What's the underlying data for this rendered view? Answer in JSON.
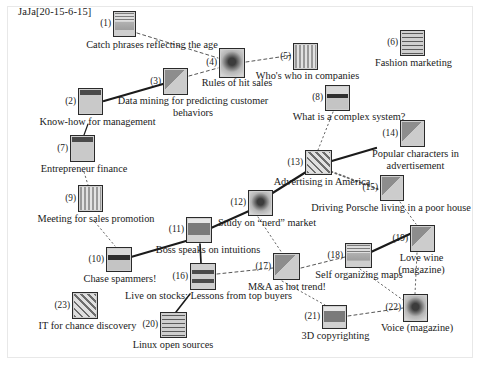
{
  "figure": {
    "title": "JaJa[20-15-6-15]",
    "type": "node-link-graph",
    "width": 480,
    "height": 366,
    "background": "#ffffff",
    "border_color": "#e8e8e8"
  },
  "nodes": [
    {
      "id": 1,
      "index": "(1)",
      "label": "Catch phrases reflecting the age",
      "x": 113,
      "y": 11,
      "w": 23,
      "h": 26,
      "tex": "t-a",
      "lx": 57,
      "ly": 39,
      "lw": 190
    },
    {
      "id": 2,
      "index": "(2)",
      "label": "Know-how for management",
      "x": 78,
      "y": 88,
      "w": 25,
      "h": 27,
      "tex": "t-b",
      "lx": 20,
      "ly": 116,
      "lw": 155
    },
    {
      "id": 3,
      "index": "(3)",
      "label": "Data mining for predicting customer behaviors",
      "x": 163,
      "y": 68,
      "w": 25,
      "h": 27,
      "tex": "t-c",
      "lx": 113,
      "ly": 95,
      "lw": 160,
      "two": true
    },
    {
      "id": 4,
      "index": "(4)",
      "label": "Rules of hit sales",
      "x": 219,
      "y": 48,
      "w": 26,
      "h": 30,
      "tex": "t-f",
      "lx": 177,
      "ly": 77,
      "lw": 120
    },
    {
      "id": 5,
      "index": "(5)",
      "label": "Who's who in companies",
      "x": 293,
      "y": 43,
      "w": 25,
      "h": 27,
      "tex": "t-d",
      "lx": 245,
      "ly": 70,
      "lw": 125
    },
    {
      "id": 6,
      "index": "(6)",
      "label": "Fashion marketing",
      "x": 400,
      "y": 30,
      "w": 25,
      "h": 26,
      "tex": "t-g",
      "lx": 361,
      "ly": 57,
      "lw": 105
    },
    {
      "id": 7,
      "index": "(7)",
      "label": "Entrepreneur finance",
      "x": 70,
      "y": 135,
      "w": 25,
      "h": 27,
      "tex": "t-b",
      "lx": 24,
      "ly": 163,
      "lw": 120
    },
    {
      "id": 8,
      "index": "(8)",
      "label": "What is a complex system?",
      "x": 325,
      "y": 85,
      "w": 25,
      "h": 26,
      "tex": "t-h",
      "lx": 279,
      "ly": 111,
      "lw": 140
    },
    {
      "id": 9,
      "index": "(9)",
      "label": "Meeting for sales promotion",
      "x": 78,
      "y": 185,
      "w": 25,
      "h": 27,
      "tex": "t-d",
      "lx": 26,
      "ly": 213,
      "lw": 140
    },
    {
      "id": 10,
      "index": "(10)",
      "label": "Chase spammers!",
      "x": 106,
      "y": 247,
      "w": 26,
      "h": 25,
      "tex": "t-h",
      "lx": 70,
      "ly": 273,
      "lw": 100
    },
    {
      "id": 11,
      "index": "(11)",
      "label": "Boss speaks on intuitions",
      "x": 186,
      "y": 217,
      "w": 26,
      "h": 26,
      "tex": "t-e",
      "lx": 143,
      "ly": 244,
      "lw": 130
    },
    {
      "id": 12,
      "index": "(12)",
      "label": "Study on “nerd” market",
      "x": 248,
      "y": 190,
      "w": 25,
      "h": 26,
      "tex": "t-f",
      "lx": 208,
      "ly": 217,
      "lw": 118
    },
    {
      "id": 13,
      "index": "(13)",
      "label": "Advertising in America",
      "x": 305,
      "y": 150,
      "w": 27,
      "h": 25,
      "tex": "t-i",
      "lx": 262,
      "ly": 176,
      "lw": 120
    },
    {
      "id": 14,
      "index": "(14)",
      "label": "Popular characters in advertisement",
      "x": 400,
      "y": 120,
      "w": 25,
      "h": 27,
      "tex": "t-c",
      "lx": 358,
      "ly": 148,
      "lw": 115,
      "two": true
    },
    {
      "id": 15,
      "index": "(15)",
      "label": "Driving Porsche living in a poor house",
      "x": 380,
      "y": 175,
      "w": 24,
      "h": 26,
      "tex": "t-c",
      "lx": 301,
      "ly": 202,
      "lw": 180
    },
    {
      "id": 16,
      "index": "(16)",
      "label": "Live on stocks: Lessons from top buyers",
      "x": 190,
      "y": 263,
      "w": 26,
      "h": 27,
      "tex": "t-j",
      "lx": 106,
      "ly": 290,
      "lw": 205
    },
    {
      "id": 17,
      "index": "(17)",
      "label": "M&A as hot trend!",
      "x": 273,
      "y": 253,
      "w": 27,
      "h": 27,
      "tex": "t-c",
      "lx": 237,
      "ly": 281,
      "lw": 100
    },
    {
      "id": 18,
      "index": "(18)",
      "label": "Self organizing maps",
      "x": 345,
      "y": 243,
      "w": 27,
      "h": 25,
      "tex": "t-a",
      "lx": 304,
      "ly": 269,
      "lw": 110
    },
    {
      "id": 19,
      "index": "(19)",
      "label": "Love wine (magazine)",
      "x": 410,
      "y": 225,
      "w": 25,
      "h": 27,
      "tex": "t-c",
      "lx": 384,
      "ly": 252,
      "lw": 75,
      "two": true
    },
    {
      "id": 20,
      "index": "(20)",
      "label": "Linux open sources",
      "x": 160,
      "y": 312,
      "w": 27,
      "h": 26,
      "tex": "t-g",
      "lx": 123,
      "ly": 339,
      "lw": 100
    },
    {
      "id": 21,
      "index": "(21)",
      "label": "3D copyrighting",
      "x": 322,
      "y": 305,
      "w": 25,
      "h": 24,
      "tex": "t-e",
      "lx": 288,
      "ly": 330,
      "lw": 95
    },
    {
      "id": 22,
      "index": "(22)",
      "label": "Voice (magazine)",
      "x": 403,
      "y": 294,
      "w": 25,
      "h": 28,
      "tex": "t-f",
      "lx": 368,
      "ly": 322,
      "lw": 98
    },
    {
      "id": 23,
      "index": "(23)",
      "label": "IT for chance discovery",
      "x": 72,
      "y": 292,
      "w": 26,
      "h": 27,
      "tex": "t-i",
      "lx": 25,
      "ly": 320,
      "lw": 125
    }
  ],
  "edges": [
    {
      "from": 1,
      "to": 4,
      "style": "dashed",
      "weight": 1,
      "x1": 137,
      "y1": 33,
      "x2": 218,
      "y2": 58
    },
    {
      "from": 2,
      "to": 3,
      "style": "solid",
      "weight": 2.3,
      "x1": 104,
      "y1": 101,
      "x2": 163,
      "y2": 84
    },
    {
      "from": 3,
      "to": 4,
      "style": "dashed",
      "weight": 1,
      "x1": 189,
      "y1": 76,
      "x2": 218,
      "y2": 68
    },
    {
      "from": 4,
      "to": 5,
      "style": "dashed",
      "weight": 1,
      "x1": 246,
      "y1": 62,
      "x2": 293,
      "y2": 55
    },
    {
      "from": 2,
      "to": 7,
      "style": "solid",
      "weight": 1.2,
      "x1": 88,
      "y1": 124,
      "x2": 84,
      "y2": 135
    },
    {
      "from": 7,
      "to": 9,
      "style": "dotted",
      "weight": 1,
      "x1": 84,
      "y1": 172,
      "x2": 88,
      "y2": 185
    },
    {
      "from": 9,
      "to": 10,
      "style": "dotted",
      "weight": 1,
      "x1": 95,
      "y1": 222,
      "x2": 115,
      "y2": 246
    },
    {
      "from": 8,
      "to": 13,
      "style": "dotted",
      "weight": 1,
      "x1": 333,
      "y1": 112,
      "x2": 318,
      "y2": 150
    },
    {
      "from": 13,
      "to": 14,
      "style": "solid",
      "weight": 2.3,
      "x1": 325,
      "y1": 163,
      "x2": 376,
      "y2": 148
    },
    {
      "from": 13,
      "to": 15,
      "style": "dotted",
      "weight": 1.8,
      "x1": 327,
      "y1": 170,
      "x2": 380,
      "y2": 190
    },
    {
      "from": 15,
      "to": 19,
      "style": "dotted",
      "weight": 1,
      "x1": 400,
      "y1": 202,
      "x2": 416,
      "y2": 224
    },
    {
      "from": 12,
      "to": 13,
      "style": "solid",
      "weight": 2.1,
      "x1": 271,
      "y1": 194,
      "x2": 306,
      "y2": 172
    },
    {
      "from": 11,
      "to": 12,
      "style": "solid",
      "weight": 2.1,
      "x1": 211,
      "y1": 228,
      "x2": 249,
      "y2": 211
    },
    {
      "from": 10,
      "to": 11,
      "style": "solid",
      "weight": 2.1,
      "x1": 131,
      "y1": 257,
      "x2": 186,
      "y2": 241
    },
    {
      "from": 11,
      "to": 16,
      "style": "solid",
      "weight": 1.7,
      "x1": 200,
      "y1": 244,
      "x2": 201,
      "y2": 263
    },
    {
      "from": 16,
      "to": 17,
      "style": "dashed",
      "weight": 1,
      "x1": 217,
      "y1": 274,
      "x2": 273,
      "y2": 268
    },
    {
      "from": 12,
      "to": 17,
      "style": "dotted",
      "weight": 1,
      "x1": 258,
      "y1": 217,
      "x2": 282,
      "y2": 253
    },
    {
      "from": 17,
      "to": 18,
      "style": "dashed",
      "weight": 1,
      "x1": 301,
      "y1": 268,
      "x2": 345,
      "y2": 257
    },
    {
      "from": 18,
      "to": 19,
      "style": "solid",
      "weight": 2.3,
      "x1": 371,
      "y1": 252,
      "x2": 412,
      "y2": 233
    },
    {
      "from": 19,
      "to": 22,
      "style": "dotted",
      "weight": 1,
      "x1": 417,
      "y1": 253,
      "x2": 415,
      "y2": 294
    },
    {
      "from": 18,
      "to": 22,
      "style": "dotted",
      "weight": 1,
      "x1": 360,
      "y1": 269,
      "x2": 403,
      "y2": 300
    },
    {
      "from": 21,
      "to": 22,
      "style": "dashed",
      "weight": 1,
      "x1": 348,
      "y1": 316,
      "x2": 403,
      "y2": 308
    },
    {
      "from": 17,
      "to": 21,
      "style": "dotted",
      "weight": 1,
      "x1": 282,
      "y1": 281,
      "x2": 325,
      "y2": 305
    },
    {
      "from": 16,
      "to": 20,
      "style": "solid",
      "weight": 1.6,
      "x1": 190,
      "y1": 294,
      "x2": 176,
      "y2": 312
    }
  ]
}
